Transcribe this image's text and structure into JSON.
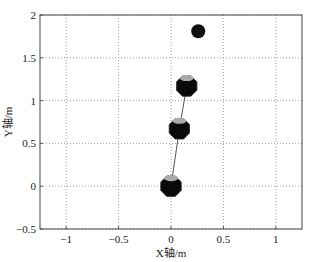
{
  "chart_data": {
    "type": "scatter",
    "title": "",
    "xlabel": "X轴/m",
    "ylabel": "Y轴/m",
    "xlim": [
      -1.25,
      1.25
    ],
    "ylim": [
      -0.5,
      2
    ],
    "xticks": [
      "-1",
      "-0.5",
      "0",
      "0.5",
      "1"
    ],
    "yticks": [
      "-0.5",
      "0",
      "0.5",
      "1",
      "1.5",
      "2"
    ],
    "grid": true,
    "series": [
      {
        "name": "target",
        "marker": "circle",
        "x": [
          0.26
        ],
        "y": [
          1.81
        ]
      },
      {
        "name": "links",
        "marker": "octagon",
        "x": [
          0.0,
          0.08,
          0.15
        ],
        "y": [
          0.0,
          0.67,
          1.17
        ]
      }
    ]
  }
}
